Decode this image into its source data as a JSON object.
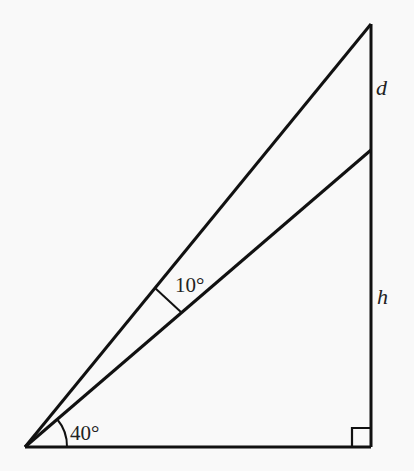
{
  "diagram": {
    "type": "right-triangle-geometry",
    "background_color": "#f9f9f9",
    "stroke_color": "#111111",
    "labels": {
      "angle_bottom": "40°",
      "angle_between": "10°",
      "segment_top": "d",
      "segment_height": "h"
    },
    "angles_deg": {
      "lower_line": 40,
      "between_lines": 10,
      "upper_line": 50
    },
    "right_angle_marker": true
  }
}
